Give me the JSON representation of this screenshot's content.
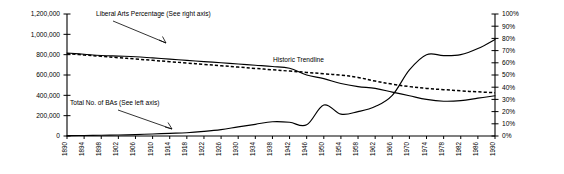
{
  "chart_data": {
    "type": "line",
    "title": "",
    "xlabel": "",
    "ylabel": "",
    "grid": false,
    "legend_position": "inline-annotations",
    "x": [
      1890,
      1894,
      1898,
      1902,
      1906,
      1910,
      1914,
      1918,
      1922,
      1926,
      1930,
      1934,
      1938,
      1942,
      1946,
      1950,
      1954,
      1958,
      1962,
      1966,
      1970,
      1974,
      1978,
      1982,
      1986,
      1990
    ],
    "xticklabels": [
      "1890",
      "1894",
      "1898",
      "1902",
      "1906",
      "1910",
      "1914",
      "1918",
      "1922",
      "1926",
      "1930",
      "1934",
      "1938",
      "1942",
      "1946",
      "1950",
      "1954",
      "1958",
      "1962",
      "1966",
      "1970",
      "1974",
      "1978",
      "1982",
      "1986",
      "1990"
    ],
    "left_axis": {
      "label": "Total No. of BAs",
      "ticklabels": [
        "0",
        "200,000",
        "400,000",
        "600,000",
        "800,000",
        "1,000,000",
        "1,200,000"
      ],
      "tickvalues": [
        0,
        200000,
        400000,
        600000,
        800000,
        1000000,
        1200000
      ],
      "ylim": [
        0,
        1200000
      ]
    },
    "right_axis": {
      "label": "Liberal Arts Percentage",
      "ticklabels": [
        "0%",
        "10%",
        "20%",
        "30%",
        "40%",
        "50%",
        "60%",
        "70%",
        "80%",
        "90%",
        "100%"
      ],
      "tickvalues": [
        0,
        10,
        20,
        30,
        40,
        50,
        60,
        70,
        80,
        90,
        100
      ],
      "ylim": [
        0,
        100
      ]
    },
    "series": [
      {
        "name": "Liberal Arts Percentage (See right axis)",
        "axis": "right",
        "style": "solid",
        "units": "percent",
        "values": [
          68,
          67,
          66,
          65.5,
          65,
          64,
          63,
          62,
          61,
          60,
          59,
          58,
          57,
          55.5,
          50,
          47,
          43,
          40.5,
          39,
          36,
          33,
          30,
          28.5,
          29,
          31,
          33
        ]
      },
      {
        "name": "Total No. of BAs (See left axis)",
        "axis": "left",
        "style": "solid",
        "units": "count",
        "values": [
          3000,
          5000,
          7000,
          10000,
          14000,
          20000,
          26000,
          32000,
          45000,
          63000,
          90000,
          115000,
          140000,
          135000,
          110000,
          305000,
          215000,
          240000,
          290000,
          400000,
          650000,
          800000,
          790000,
          800000,
          860000,
          950000
        ]
      },
      {
        "name": "Historic Trendline",
        "axis": "right",
        "style": "dashed",
        "units": "percent",
        "values": [
          67.5,
          66.4,
          65.3,
          64.2,
          63.1,
          62,
          60.9,
          59.8,
          58.7,
          57.6,
          56.5,
          55.4,
          54.3,
          53.2,
          52.1,
          51,
          49.9,
          48,
          45,
          42.5,
          40.5,
          39,
          38,
          37,
          36.2,
          35.5
        ]
      }
    ],
    "annotations": [
      {
        "name": "liberal-arts-annotation",
        "text": "Liberal  Arts Percentage (See right axis)"
      },
      {
        "name": "total-bas-annotation",
        "text": "Total No. of BAs (See left axis)"
      },
      {
        "name": "historic-trendline-annotation",
        "text": "Historic Trendline"
      }
    ]
  }
}
